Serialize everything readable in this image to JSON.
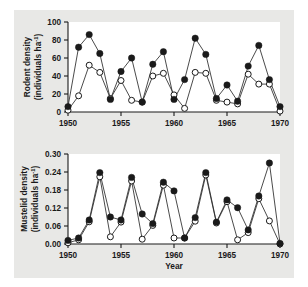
{
  "figure": {
    "background_color": "#e8e8e6",
    "plot_background_color": "#ffffff",
    "ink_color": "#1a1a1a"
  },
  "chart_data": [
    {
      "type": "line",
      "panel": "top",
      "title": "",
      "xlabel": "",
      "ylabel": "Rodent density (individuals ha⁻¹)",
      "ylabel_line1": "Rodent density",
      "ylabel_line2": "(individuals ha",
      "ylabel_line2_sup": "-1",
      "ylabel_line2_end": ")",
      "xlim": [
        1950,
        1970
      ],
      "ylim": [
        0,
        100
      ],
      "yticks": [
        0,
        20,
        40,
        60,
        80,
        100
      ],
      "ytick_labels": [
        "0",
        "20",
        "40",
        "60",
        "80",
        "100"
      ],
      "xticks": [
        1950,
        1955,
        1960,
        1965,
        1970
      ],
      "xtick_labels": [
        "1950",
        "1955",
        "1960",
        "1965",
        "1970"
      ],
      "grid": false,
      "legend": false,
      "x": [
        1950,
        1951,
        1952,
        1953,
        1954,
        1955,
        1956,
        1957,
        1958,
        1959,
        1960,
        1961,
        1962,
        1963,
        1964,
        1965,
        1966,
        1967,
        1968,
        1969,
        1970
      ],
      "series": [
        {
          "name": "observed",
          "marker": "filled-circle",
          "values": [
            6,
            72,
            86,
            65,
            14,
            45,
            60,
            11,
            53,
            67,
            14,
            36,
            82,
            64,
            15,
            30,
            12,
            51,
            74,
            36,
            6
          ]
        },
        {
          "name": "predicted",
          "marker": "open-circle",
          "values": [
            2,
            18,
            52,
            44,
            15,
            35,
            13,
            11,
            40,
            43,
            19,
            4,
            44,
            43,
            13,
            11,
            9,
            42,
            31,
            31,
            1
          ]
        }
      ]
    },
    {
      "type": "line",
      "panel": "bottom",
      "title": "",
      "xlabel": "Year",
      "ylabel": "Mustelid density (individuals ha⁻¹)",
      "ylabel_line1": "Mustelid density",
      "ylabel_line2": "(individuals ha",
      "ylabel_line2_sup": "-1",
      "ylabel_line2_end": ")",
      "xlim": [
        1950,
        1970
      ],
      "ylim": [
        0.0,
        0.3
      ],
      "yticks": [
        0.0,
        0.06,
        0.12,
        0.18,
        0.24,
        0.3
      ],
      "ytick_labels": [
        "0.00",
        "0.06",
        "0.12",
        "0.18",
        "0.24",
        "0.30"
      ],
      "xticks": [
        1950,
        1955,
        1960,
        1965,
        1970
      ],
      "xtick_labels": [
        "1950",
        "1955",
        "1960",
        "1965",
        "1970"
      ],
      "grid": false,
      "legend": false,
      "x": [
        1950,
        1951,
        1952,
        1953,
        1954,
        1955,
        1956,
        1957,
        1958,
        1959,
        1960,
        1961,
        1962,
        1963,
        1964,
        1965,
        1966,
        1967,
        1968,
        1969,
        1970
      ],
      "series": [
        {
          "name": "observed",
          "marker": "filled-circle",
          "values": [
            0.012,
            0.02,
            0.08,
            0.238,
            0.09,
            0.08,
            0.222,
            0.1,
            0.068,
            0.206,
            0.177,
            0.02,
            0.088,
            0.238,
            0.073,
            0.147,
            0.121,
            0.047,
            0.16,
            0.27,
            0.002
          ]
        },
        {
          "name": "predicted",
          "marker": "open-circle",
          "values": [
            0.004,
            0.014,
            0.074,
            0.224,
            0.024,
            0.073,
            0.21,
            0.016,
            0.062,
            0.196,
            0.02,
            0.02,
            0.076,
            0.23,
            0.07,
            0.141,
            0.014,
            0.038,
            0.151,
            0.077,
            0.0
          ]
        }
      ]
    }
  ]
}
